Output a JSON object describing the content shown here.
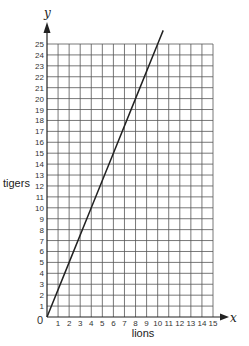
{
  "chart_data": {
    "type": "line",
    "title": "",
    "xlabel": "lions",
    "ylabel": "tigers",
    "x_axis_symbol": "x",
    "y_axis_symbol": "y",
    "origin_label": "0",
    "xlim": [
      0,
      15
    ],
    "ylim": [
      0,
      25
    ],
    "x_ticks": [
      1,
      2,
      3,
      4,
      5,
      6,
      7,
      8,
      9,
      10,
      11,
      12,
      13,
      14,
      15
    ],
    "y_ticks": [
      1,
      2,
      3,
      4,
      5,
      6,
      7,
      8,
      9,
      10,
      11,
      12,
      13,
      14,
      15,
      16,
      17,
      18,
      19,
      20,
      21,
      22,
      23,
      24,
      25
    ],
    "grid": true,
    "legend": null,
    "series": [
      {
        "name": "tigers vs lions",
        "equation": "y = 2.5x",
        "x": [
          0,
          2,
          4,
          6,
          8,
          10,
          10.5
        ],
        "y": [
          0,
          5,
          10,
          15,
          20,
          25,
          26.25
        ],
        "color": "#222222"
      }
    ]
  },
  "colors": {
    "grid": "#555555",
    "axis": "#222222",
    "line": "#222222",
    "background": "#ffffff"
  }
}
